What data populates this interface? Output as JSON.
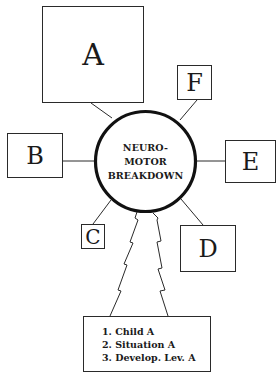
{
  "diagram": {
    "center": {
      "lines": [
        "NEURO-",
        "MOTOR",
        "BREAKDOWN"
      ]
    },
    "boxes": {
      "A": "A",
      "B": "B",
      "C": "C",
      "D": "D",
      "E": "E",
      "F": "F"
    },
    "factors": [
      "1. Child A",
      "2. Situation A",
      "3. Develop. Lev. A"
    ],
    "colors": {
      "stroke": "#1a1a1a",
      "background": "#ffffff"
    }
  }
}
